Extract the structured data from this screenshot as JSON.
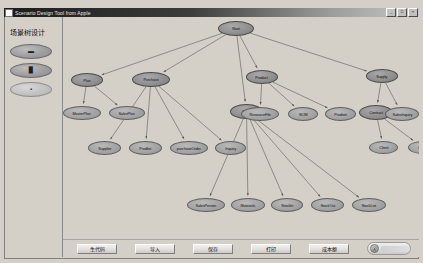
{
  "window": {
    "title": "Scenario Design Tool from Apple",
    "icon": "app-icon",
    "controls": [
      {
        "name": "minimize",
        "glyph": "_"
      },
      {
        "name": "maximize",
        "glyph": "□"
      },
      {
        "name": "close",
        "glyph": "×"
      }
    ]
  },
  "sidebar": {
    "title": "场景树设计",
    "tools": [
      {
        "name": "tool-select",
        "glyph": "▬"
      },
      {
        "name": "tool-node",
        "glyph": "▉"
      },
      {
        "name": "tool-link",
        "glyph": "▪"
      }
    ]
  },
  "bottom_bar": {
    "buttons": [
      {
        "name": "generate-code-button",
        "label": "生代码",
        "x": 14,
        "width": 40
      },
      {
        "name": "import-button",
        "label": "导入",
        "x": 72,
        "width": 40
      },
      {
        "name": "save-button",
        "label": "保存",
        "x": 130,
        "width": 40
      },
      {
        "name": "print-button",
        "label": "打印",
        "x": 188,
        "width": 40
      },
      {
        "name": "cost-button",
        "label": "成本额",
        "x": 246,
        "width": 40
      }
    ],
    "status_pill": {
      "icon_glyph": "Ⓐ",
      "text": ""
    }
  },
  "graph": {
    "nodes": [
      {
        "id": "root",
        "label": "Root",
        "x": 155,
        "y": 4,
        "w": 36,
        "h": 15,
        "dark": true
      },
      {
        "id": "plan",
        "label": "Plan",
        "x": 8,
        "y": 56,
        "w": 32,
        "h": 14,
        "dark": true
      },
      {
        "id": "purchase",
        "label": "Purchase",
        "x": 69,
        "y": 55,
        "w": 38,
        "h": 15,
        "dark": true
      },
      {
        "id": "product",
        "label": "Product",
        "x": 183,
        "y": 53,
        "w": 32,
        "h": 14,
        "dark": true
      },
      {
        "id": "supply",
        "label": "Supply",
        "x": 303,
        "y": 52,
        "w": 32,
        "h": 14,
        "dark": true
      },
      {
        "id": "masterplan",
        "label": "MasterPlan",
        "x": 0,
        "y": 89,
        "w": 38,
        "h": 14,
        "dark": false
      },
      {
        "id": "salesplan",
        "label": "SalesPlan",
        "x": 46,
        "y": 89,
        "w": 36,
        "h": 14,
        "dark": false
      },
      {
        "id": "supplier",
        "label": "Supplier",
        "x": 25,
        "y": 124,
        "w": 33,
        "h": 14,
        "dark": false
      },
      {
        "id": "prodlist",
        "label": "Prodlist",
        "x": 66,
        "y": 124,
        "w": 33,
        "h": 14,
        "dark": false
      },
      {
        "id": "purchaseorder",
        "label": "purchaseOrder",
        "x": 107,
        "y": 124,
        "w": 38,
        "h": 14,
        "dark": false
      },
      {
        "id": "inquiry",
        "label": "Inquiry",
        "x": 152,
        "y": 124,
        "w": 31,
        "h": 14,
        "dark": false
      },
      {
        "id": "stock",
        "label": "Stock",
        "x": 167,
        "y": 87,
        "w": 33,
        "h": 15,
        "dark": true
      },
      {
        "id": "housefile",
        "label": "HouseFile",
        "x": 177,
        "y": 87,
        "w": 0,
        "h": 0,
        "dark": false
      },
      {
        "id": "resourcefile",
        "label": "ResourceFile",
        "x": 178,
        "y": 90,
        "w": 38,
        "h": 14,
        "dark": false
      },
      {
        "id": "bom",
        "label": "BOM",
        "x": 225,
        "y": 90,
        "w": 30,
        "h": 14,
        "dark": false
      },
      {
        "id": "prodset",
        "label": "Prodset",
        "x": 262,
        "y": 90,
        "w": 31,
        "h": 14,
        "dark": false
      },
      {
        "id": "contract",
        "label": "Contract",
        "x": 296,
        "y": 88,
        "w": 34,
        "h": 15,
        "dark": true
      },
      {
        "id": "salesinquiry",
        "label": "SalesInquiry",
        "x": 322,
        "y": 90,
        "w": 34,
        "h": 14,
        "dark": false
      },
      {
        "id": "client",
        "label": "Client",
        "x": 306,
        "y": 124,
        "w": 29,
        "h": 13,
        "dark": false
      },
      {
        "id": "order",
        "label": "Order",
        "x": 345,
        "y": 124,
        "w": 29,
        "h": 13,
        "dark": false
      },
      {
        "id": "salesperson",
        "label": "SalesPerson",
        "x": 124,
        "y": 181,
        "w": 38,
        "h": 14,
        "dark": false
      },
      {
        "id": "materials",
        "label": "Materials",
        "x": 168,
        "y": 181,
        "w": 34,
        "h": 14,
        "dark": false
      },
      {
        "id": "stockin",
        "label": "StockIn",
        "x": 208,
        "y": 181,
        "w": 32,
        "h": 14,
        "dark": false
      },
      {
        "id": "stockout",
        "label": "StockOut",
        "x": 248,
        "y": 181,
        "w": 33,
        "h": 14,
        "dark": false
      },
      {
        "id": "stocklist",
        "label": "StockList",
        "x": 289,
        "y": 181,
        "w": 34,
        "h": 14,
        "dark": false
      }
    ],
    "edges": [
      {
        "from": "root",
        "to": "plan"
      },
      {
        "from": "root",
        "to": "purchase"
      },
      {
        "from": "root",
        "to": "product"
      },
      {
        "from": "root",
        "to": "supply"
      },
      {
        "from": "root",
        "to": "stock"
      },
      {
        "from": "plan",
        "to": "masterplan"
      },
      {
        "from": "plan",
        "to": "salesplan"
      },
      {
        "from": "purchase",
        "to": "supplier"
      },
      {
        "from": "purchase",
        "to": "prodlist"
      },
      {
        "from": "purchase",
        "to": "purchaseorder"
      },
      {
        "from": "purchase",
        "to": "inquiry"
      },
      {
        "from": "product",
        "to": "resourcefile"
      },
      {
        "from": "product",
        "to": "bom"
      },
      {
        "from": "product",
        "to": "prodset"
      },
      {
        "from": "supply",
        "to": "contract"
      },
      {
        "from": "supply",
        "to": "salesinquiry"
      },
      {
        "from": "contract",
        "to": "client"
      },
      {
        "from": "contract",
        "to": "order"
      },
      {
        "from": "stock",
        "to": "salesperson"
      },
      {
        "from": "stock",
        "to": "materials"
      },
      {
        "from": "stock",
        "to": "stockin"
      },
      {
        "from": "stock",
        "to": "stockout"
      },
      {
        "from": "stock",
        "to": "stocklist"
      }
    ]
  },
  "colors": {
    "window_face": "#d4d0c8",
    "node_fill": "#a3a3a3",
    "node_fill_dark": "#8f8f8f",
    "edge": "#5a5a5a"
  }
}
